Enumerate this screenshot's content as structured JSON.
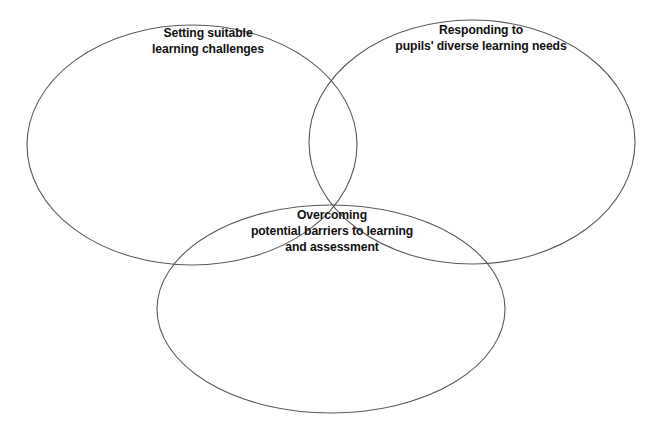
{
  "diagram": {
    "type": "venn-three-circle",
    "title": "",
    "background_color": "#ffffff",
    "stroke_color": "#5a5a5a",
    "text_color": "#111111",
    "circles": [
      {
        "id": "setting-suitable-learning-challenges",
        "position": "top-left",
        "cx": 192,
        "cy": 145,
        "rx": 165,
        "ry": 120,
        "label_lines": [
          "Setting suitable",
          "learning challenges"
        ],
        "label_text": "Setting suitable learning challenges"
      },
      {
        "id": "responding-to-pupils-diverse-learning-needs",
        "position": "top-right",
        "cx": 472,
        "cy": 142,
        "rx": 163,
        "ry": 122,
        "label_lines": [
          "Responding to",
          "pupils' diverse learning needs"
        ],
        "label_text": "Responding to pupils' diverse learning needs"
      },
      {
        "id": "overcoming-potential-barriers-to-learning-and-assessment",
        "position": "bottom-center",
        "cx": 331,
        "cy": 309,
        "rx": 174,
        "ry": 104,
        "label_lines": [
          "Overcoming",
          "potential barriers to learning",
          "and assessment"
        ],
        "label_text": "Overcoming potential barriers to learning and assessment"
      }
    ]
  },
  "labels": {
    "setting": {
      "line1": "Setting suitable",
      "line2": "learning challenges"
    },
    "responding": {
      "line1": "Responding to",
      "line2": "pupils' diverse learning needs"
    },
    "overcoming": {
      "line1": "Overcoming",
      "line2": "potential barriers to learning",
      "line3": "and assessment"
    }
  }
}
